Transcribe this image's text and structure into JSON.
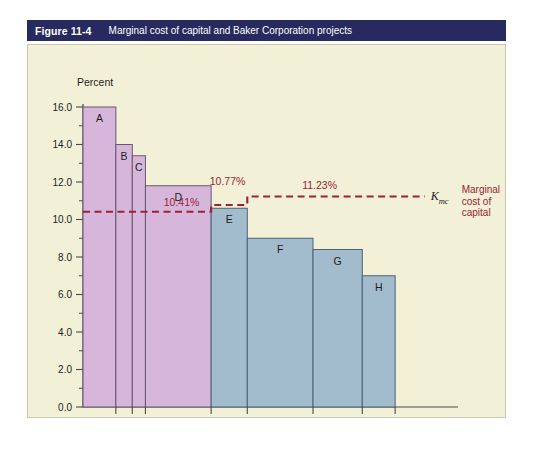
{
  "figure": {
    "number": "Figure 11-4",
    "title": "Marginal cost of capital and Baker Corporation projects"
  },
  "legend": {
    "kmc_symbol": "K",
    "kmc_subscript": "mc",
    "line1": "Marginal",
    "line2": "cost of",
    "line3": "capital"
  },
  "chart_data": {
    "type": "bar",
    "title": "Marginal cost of capital and Baker Corporation projects",
    "xlabel": "Amount of capital ($ millions)",
    "ylabel": "Percent",
    "ylim": [
      0.0,
      16.0
    ],
    "xlim": [
      0,
      105
    ],
    "ytick_labels": [
      "0.0",
      "2.0",
      "4.0",
      "6.0",
      "8.0",
      "10.0",
      "12.0",
      "14.0",
      "16.0"
    ],
    "ytick_values": [
      0.0,
      2.0,
      4.0,
      6.0,
      8.0,
      10.0,
      12.0,
      14.0,
      16.0
    ],
    "yminor_step": 1.0,
    "xtick_labels": [
      "10",
      "15",
      "19",
      "39",
      "50",
      "70",
      "85",
      "95"
    ],
    "xtick_values": [
      10,
      15,
      19,
      39,
      50,
      70,
      85,
      95
    ],
    "grid": false,
    "legend_position": "right",
    "bars": [
      {
        "label": "A",
        "x_start": 0,
        "x_end": 10,
        "value": 16.0,
        "color": "#D6B7DB",
        "group": "projects-low"
      },
      {
        "label": "B",
        "x_start": 10,
        "x_end": 15,
        "value": 14.0,
        "color": "#D6B7DB",
        "group": "projects-low"
      },
      {
        "label": "C",
        "x_start": 15,
        "x_end": 19,
        "value": 13.4,
        "color": "#D6B7DB",
        "group": "projects-low"
      },
      {
        "label": "D",
        "x_start": 19,
        "x_end": 39,
        "value": 11.8,
        "color": "#D6B7DB",
        "group": "projects-low"
      },
      {
        "label": "E",
        "x_start": 39,
        "x_end": 50,
        "value": 10.6,
        "color": "#A2BCCD",
        "group": "projects-high"
      },
      {
        "label": "F",
        "x_start": 50,
        "x_end": 70,
        "value": 9.0,
        "color": "#A2BCCD",
        "group": "projects-high"
      },
      {
        "label": "G",
        "x_start": 70,
        "x_end": 85,
        "value": 8.4,
        "color": "#A2BCCD",
        "group": "projects-high"
      },
      {
        "label": "H",
        "x_start": 85,
        "x_end": 95,
        "value": 7.0,
        "color": "#A2BCCD",
        "group": "projects-high"
      }
    ],
    "mcc_steps": [
      {
        "label": "10.41%",
        "value": 10.41,
        "x_start": 0,
        "x_end": 39
      },
      {
        "label": "10.77%",
        "value": 10.77,
        "x_start": 39,
        "x_end": 50
      },
      {
        "label": "11.23%",
        "value": 11.23,
        "x_start": 50,
        "x_end": 104
      }
    ],
    "mcc_line_color": "#9B2335",
    "series_name": "Marginal cost of capital"
  },
  "colors": {
    "title_bar": "#262A5E",
    "panel_bg": "#F2F0D6",
    "bar_purple": "#D6B7DB",
    "bar_blue": "#A2BCCD",
    "mcc_red": "#9B2335"
  }
}
